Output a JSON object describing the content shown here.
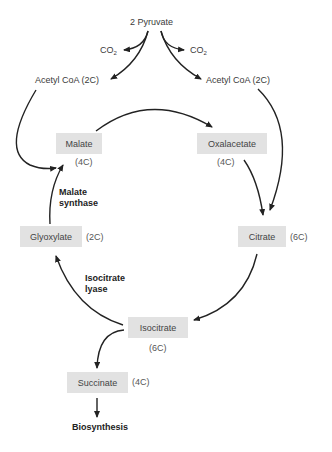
{
  "diagram": {
    "start": {
      "label": "2 Pyruvate"
    },
    "co2_left": {
      "label": "CO",
      "sub": "2"
    },
    "co2_right": {
      "label": "CO",
      "sub": "2"
    },
    "acetyl_left": {
      "label": "Acetyl CoA (2C)"
    },
    "acetyl_right": {
      "label": "Acetyl CoA (2C)"
    },
    "nodes": {
      "malate": {
        "label": "Malate",
        "carbons": "(4C)"
      },
      "oxalacetate": {
        "label": "Oxalacetate",
        "carbons": "(4C)"
      },
      "citrate": {
        "label": "Citrate",
        "carbons": "(6C)"
      },
      "isocitrate": {
        "label": "Isocitrate",
        "carbons": "(6C)"
      },
      "glyoxylate": {
        "label": "Glyoxylate",
        "carbons": "(2C)"
      },
      "succinate": {
        "label": "Succinate",
        "carbons": "(4C)"
      }
    },
    "enzymes": {
      "malate_synthase": {
        "line1": "Malate",
        "line2": "synthase"
      },
      "isocitrate_lyase": {
        "line1": "Isocitrate",
        "line2": "lyase"
      }
    },
    "end": {
      "label": "Biosynthesis"
    },
    "colors": {
      "box": "#e2e2e2",
      "arrow": "#222222",
      "text": "#3a3a3a"
    }
  }
}
